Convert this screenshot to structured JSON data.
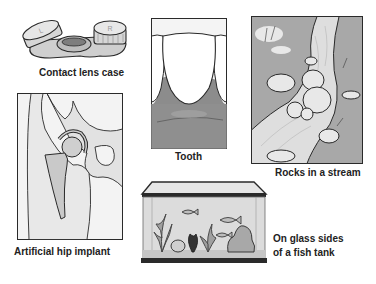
{
  "figure": {
    "panels": [
      {
        "id": "contact-lens-case",
        "label": "Contact lens case",
        "icon": "contact-lens-case-icon"
      },
      {
        "id": "tooth",
        "label": "Tooth",
        "icon": "tooth-icon"
      },
      {
        "id": "rocks-in-stream",
        "label": "Rocks in a stream",
        "icon": "stream-rocks-icon"
      },
      {
        "id": "hip-implant",
        "label": "Artificial hip implant",
        "icon": "hip-implant-icon"
      },
      {
        "id": "fish-tank",
        "label_line1": "On glass sides",
        "label_line2": "of a fish tank",
        "icon": "fish-tank-icon"
      }
    ],
    "colors": {
      "background": "#ffffff",
      "outline": "#2a2a2a",
      "light_gray": "#e4e4e4",
      "mid_gray": "#bdbdbd",
      "dark_gray": "#9a9a9a",
      "text": "#222222"
    }
  }
}
